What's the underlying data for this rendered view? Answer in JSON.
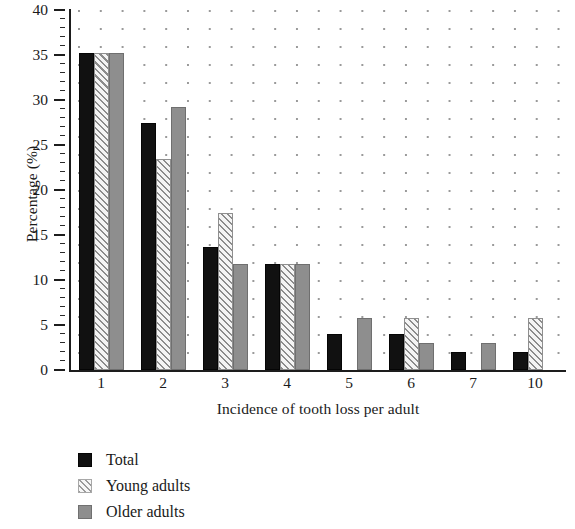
{
  "chart_data": {
    "type": "bar",
    "title": "",
    "xlabel": "Incidence of tooth loss per adult",
    "ylabel": "Percentage (%)",
    "categories": [
      "1",
      "2",
      "3",
      "4",
      "5",
      "6",
      "7",
      "10"
    ],
    "series": [
      {
        "name": "Total",
        "values": [
          35.2,
          27.5,
          13.7,
          11.8,
          4.0,
          4.0,
          2.0,
          2.0
        ]
      },
      {
        "name": "Young adults",
        "values": [
          35.2,
          23.4,
          17.5,
          11.8,
          0,
          5.8,
          0,
          5.8
        ]
      },
      {
        "name": "Older adults",
        "values": [
          35.2,
          29.2,
          11.8,
          11.8,
          5.8,
          3.0,
          3.0,
          0
        ]
      }
    ],
    "ylim": [
      0,
      40
    ],
    "ytick_values": [
      0,
      5,
      10,
      15,
      20,
      25,
      30,
      35,
      40
    ],
    "ytick_labels": [
      "0",
      "5",
      "10",
      "15",
      "20",
      "25",
      "30",
      "35",
      "40"
    ],
    "yminor_step": 1,
    "grid": "dotted",
    "legend_position": "below-left",
    "colors": {
      "total": "#111111",
      "young_adults": "#f2f2f2",
      "older_adults": "#8e8e8e",
      "grid_dot": "#9a9a9a",
      "axis": "#1d1d1d",
      "text": "#1a1a1a"
    }
  },
  "legend": {
    "items": [
      {
        "label": "Total",
        "swatch": "solid-black-swatch"
      },
      {
        "label": "Young adults",
        "swatch": "diagonal-hatch-swatch"
      },
      {
        "label": "Older adults",
        "swatch": "solid-gray-swatch"
      }
    ]
  }
}
